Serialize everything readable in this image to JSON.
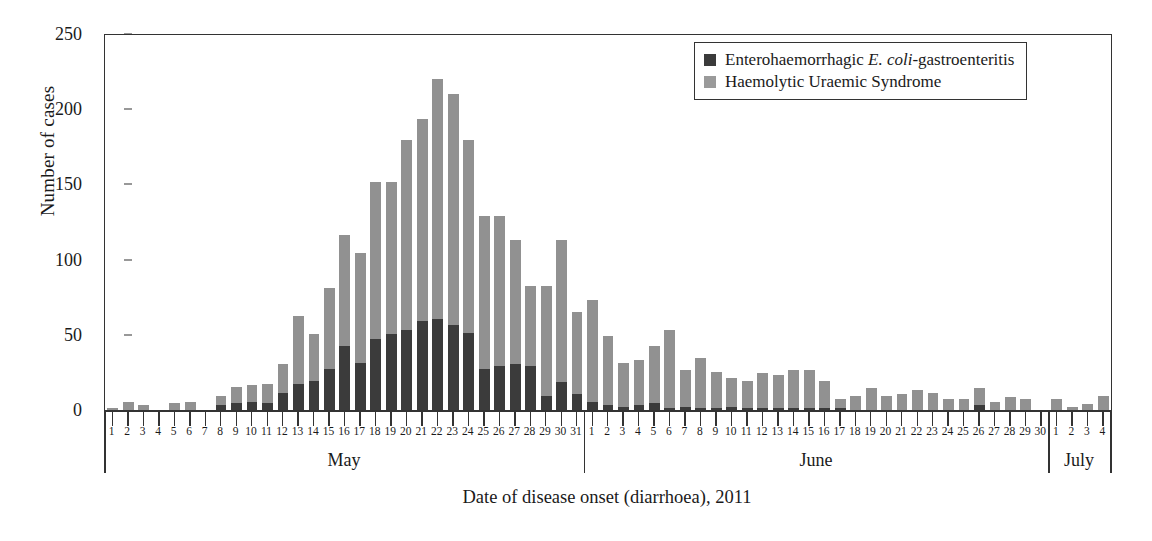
{
  "chart_data": {
    "type": "bar",
    "subtype": "stacked-bar-epidemic-curve",
    "title": "",
    "xlabel": "Date of disease onset (diarrhoea), 2011",
    "ylabel": "Number of cases",
    "ylim": [
      0,
      250
    ],
    "yticks": [
      0,
      50,
      100,
      150,
      200,
      250
    ],
    "grid": false,
    "legend_position": "top-right",
    "colors": {
      "ehec": "#3b3b3b",
      "hus": "#919191",
      "axis": "#333333",
      "background": "#ffffff"
    },
    "months": [
      {
        "name": "May",
        "days": 31
      },
      {
        "name": "June",
        "days": 30
      },
      {
        "name": "July",
        "days": 4
      }
    ],
    "categories": [
      "May 1",
      "May 2",
      "May 3",
      "May 4",
      "May 5",
      "May 6",
      "May 7",
      "May 8",
      "May 9",
      "May 10",
      "May 11",
      "May 12",
      "May 13",
      "May 14",
      "May 15",
      "May 16",
      "May 17",
      "May 18",
      "May 19",
      "May 20",
      "May 21",
      "May 22",
      "May 23",
      "May 24",
      "May 25",
      "May 26",
      "May 27",
      "May 28",
      "May 29",
      "May 30",
      "May 31",
      "Jun 1",
      "Jun 2",
      "Jun 3",
      "Jun 4",
      "Jun 5",
      "Jun 6",
      "Jun 7",
      "Jun 8",
      "Jun 9",
      "Jun 10",
      "Jun 11",
      "Jun 12",
      "Jun 13",
      "Jun 14",
      "Jun 15",
      "Jun 16",
      "Jun 17",
      "Jun 18",
      "Jun 19",
      "Jun 20",
      "Jun 21",
      "Jun 22",
      "Jun 23",
      "Jun 24",
      "Jun 25",
      "Jun 26",
      "Jun 27",
      "Jun 28",
      "Jun 29",
      "Jun 30",
      "Jul 1",
      "Jul 2",
      "Jul 3",
      "Jul 4"
    ],
    "day_labels": [
      "1",
      "2",
      "3",
      "4",
      "5",
      "6",
      "7",
      "8",
      "9",
      "10",
      "11",
      "12",
      "13",
      "14",
      "15",
      "16",
      "17",
      "18",
      "19",
      "20",
      "21",
      "22",
      "23",
      "24",
      "25",
      "26",
      "27",
      "28",
      "29",
      "30",
      "31",
      "1",
      "2",
      "3",
      "4",
      "5",
      "6",
      "7",
      "8",
      "9",
      "10",
      "11",
      "12",
      "13",
      "14",
      "15",
      "16",
      "17",
      "18",
      "19",
      "20",
      "21",
      "22",
      "23",
      "24",
      "25",
      "26",
      "27",
      "28",
      "29",
      "30",
      "1",
      "2",
      "3",
      "4"
    ],
    "series": [
      {
        "name": "Enterohaemorrhagic E. coli-gastroenteritis",
        "color": "#3b3b3b",
        "values": [
          0,
          0,
          0,
          0,
          0,
          0,
          0,
          4,
          5,
          6,
          5,
          12,
          18,
          20,
          28,
          43,
          32,
          48,
          51,
          54,
          60,
          61,
          57,
          52,
          28,
          30,
          31,
          30,
          10,
          19,
          11,
          6,
          4,
          3,
          4,
          5,
          2,
          3,
          2,
          2,
          3,
          2,
          2,
          2,
          2,
          2,
          2,
          2,
          1,
          1,
          1,
          1,
          1,
          1,
          1,
          1,
          4,
          1,
          1,
          1,
          0,
          1,
          1,
          1,
          1
        ]
      },
      {
        "name": "Haemolytic Uraemic Syndrome",
        "color": "#919191",
        "values": [
          2,
          6,
          4,
          0,
          5,
          6,
          1,
          6,
          11,
          11,
          13,
          19,
          45,
          31,
          54,
          74,
          73,
          104,
          101,
          126,
          134,
          160,
          154,
          128,
          102,
          100,
          83,
          53,
          73,
          95,
          55,
          68,
          46,
          29,
          30,
          38,
          52,
          24,
          33,
          24,
          19,
          18,
          23,
          22,
          25,
          25,
          18,
          6,
          9,
          14,
          9,
          10,
          13,
          11,
          7,
          7,
          11,
          5,
          8,
          7,
          1,
          7,
          2,
          4,
          9
        ]
      }
    ],
    "totals": [
      2,
      6,
      4,
      0,
      5,
      6,
      1,
      10,
      16,
      17,
      18,
      31,
      63,
      51,
      82,
      117,
      105,
      152,
      152,
      180,
      194,
      221,
      211,
      180,
      130,
      130,
      114,
      83,
      83,
      114,
      66,
      74,
      50,
      32,
      34,
      43,
      54,
      27,
      35,
      26,
      22,
      20,
      25,
      24,
      27,
      27,
      20,
      8,
      10,
      15,
      10,
      11,
      14,
      12,
      8,
      8,
      15,
      6,
      9,
      8,
      1,
      8,
      3,
      5,
      10
    ]
  },
  "legend": {
    "entries": [
      {
        "label_prefix": "Enterohaemorrhagic ",
        "label_italic": "E. coli",
        "label_suffix": "-gastroenteritis",
        "swatch": "dark"
      },
      {
        "label_prefix": "Haemolytic Uraemic Syndrome",
        "label_italic": "",
        "label_suffix": "",
        "swatch": "gray"
      }
    ]
  },
  "axes": {
    "y_title": "Number of cases",
    "x_title": "Date of disease onset (diarrhoea), 2011",
    "y_tick_labels": [
      "0",
      "50",
      "100",
      "150",
      "200",
      "250"
    ]
  }
}
